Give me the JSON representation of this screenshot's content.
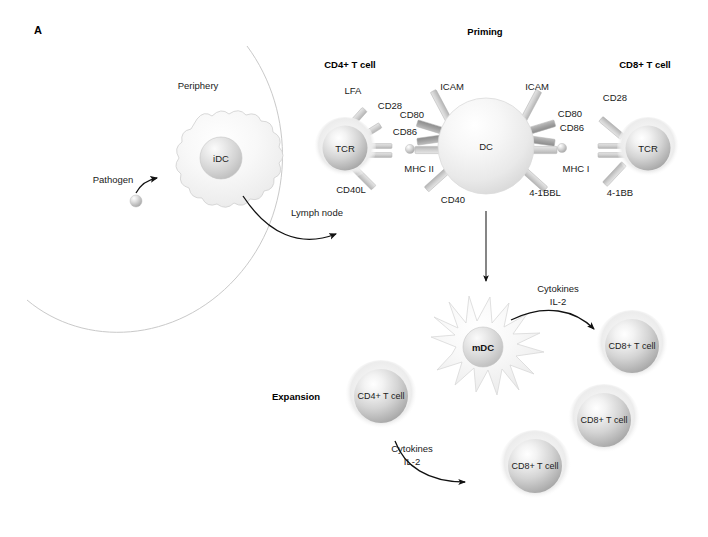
{
  "figure": {
    "panel_label": "A",
    "background": "#ffffff"
  },
  "sections": {
    "priming_title": "Priming",
    "expansion_title": "Expansion"
  },
  "periphery": {
    "region_label": "Periphery",
    "lymph_node_label": "Lymph node",
    "pathogen_label": "Pathogen",
    "idc_label": "iDC"
  },
  "priming": {
    "cd4_cell_title": "CD4+ T cell",
    "cd8_cell_title": "CD8+ T cell",
    "dc_label": "DC",
    "tcr_left_label": "TCR",
    "tcr_right_label": "TCR",
    "cd4_receptors": [
      {
        "name": "LFA",
        "label": "LFA"
      },
      {
        "name": "CD28",
        "label": "CD28"
      },
      {
        "name": "CD40L",
        "label": "CD40L"
      }
    ],
    "dc_left_receptors": [
      {
        "name": "ICAM",
        "label": "ICAM"
      },
      {
        "name": "CD80",
        "label": "CD80"
      },
      {
        "name": "CD86",
        "label": "CD86"
      },
      {
        "name": "MHC-II",
        "label": "MHC II"
      },
      {
        "name": "CD40",
        "label": "CD40"
      }
    ],
    "dc_right_receptors": [
      {
        "name": "ICAM",
        "label": "ICAM"
      },
      {
        "name": "CD80",
        "label": "CD80"
      },
      {
        "name": "CD86",
        "label": "CD86"
      },
      {
        "name": "MHC-I",
        "label": "MHC I"
      },
      {
        "name": "4-1BBL",
        "label": "4-1BBL"
      }
    ],
    "cd8_receptors": [
      {
        "name": "CD28",
        "label": "CD28"
      },
      {
        "name": "4-1BB",
        "label": "4-1BB"
      }
    ]
  },
  "expansion": {
    "mdc_label": "mDC",
    "cd4_cell_label": "CD4+ T cell",
    "cytokines_top_line1": "Cytokines",
    "cytokines_top_line2": "IL-2",
    "cytokines_bottom_line1": "Cytokines",
    "cytokines_bottom_line2": "IL-2",
    "cd8_cells": [
      {
        "label": "CD8+ T cell"
      },
      {
        "label": "CD8+ T cell"
      },
      {
        "label": "CD8+ T cell"
      }
    ]
  },
  "colors": {
    "background": "#ffffff",
    "text": "#1a1a1a",
    "arc": "#c9c9c9",
    "arrow": "#111111",
    "cell_halo": "#f2f2f2",
    "cell_core_light": "#fdfdfd",
    "cell_core_mid": "#d8d8d8",
    "cell_core_dark": "#a8a8a8",
    "receptor_light": "#d2d2d2",
    "receptor_dark": "#9e9e9e"
  }
}
